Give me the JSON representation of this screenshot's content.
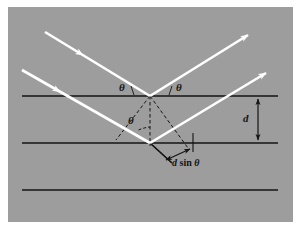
{
  "figure": {
    "panel_background": "#9d9d9d",
    "page_background": "#ffffff",
    "beam_color": "#ffffff",
    "line_color": "#141414",
    "width": 300,
    "height": 230
  },
  "labels": {
    "theta_left": "θ",
    "theta_right": "θ",
    "theta_middle": "θ",
    "spacing": "d",
    "path_difference_d": "d",
    "path_difference_rest": " sin ",
    "path_difference_theta": "θ",
    "path_difference_full": "d sin θ"
  },
  "geometry": {
    "planes": [
      {
        "name": "plane-1",
        "y": 96,
        "x1": 22,
        "x2": 278
      },
      {
        "name": "plane-2",
        "y": 143,
        "x1": 22,
        "x2": 278
      },
      {
        "name": "plane-3",
        "y": 190,
        "x1": 22,
        "x2": 278
      }
    ],
    "top_vertex": {
      "x": 150,
      "y": 96
    },
    "lower_vertex": {
      "x": 150,
      "y": 143
    },
    "beams": [
      {
        "name": "incident-beam-upper",
        "from": [
          45,
          32
        ],
        "to": [
          150,
          96
        ]
      },
      {
        "name": "reflected-beam-upper",
        "from": [
          150,
          96
        ],
        "to": [
          252,
          33
        ]
      },
      {
        "name": "incident-beam-lower",
        "from": [
          22,
          70
        ],
        "to": [
          150,
          143
        ]
      },
      {
        "name": "reflected-beam-lower",
        "from": [
          150,
          143
        ],
        "to": [
          270,
          70
        ]
      }
    ],
    "spacing_arrow": {
      "x": 258,
      "y1": 96,
      "y2": 143
    },
    "angle_degrees": 31
  },
  "icons": {
    "arrowhead": "arrowhead-icon",
    "double-arrow": "double-headed-arrow-icon"
  }
}
